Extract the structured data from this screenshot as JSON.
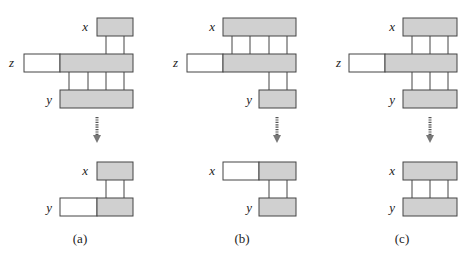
{
  "colors": {
    "filled": "#d0d0d0",
    "empty": "#ffffff",
    "stroke": "#444444"
  },
  "panels": [
    {
      "caption": "(a)",
      "labels": {
        "x_top": "x",
        "z": "z",
        "y_top": "y",
        "x_bottom": "x",
        "y_bottom": "y"
      }
    },
    {
      "caption": "(b)",
      "labels": {
        "x_top": "x",
        "z": "z",
        "y_top": "y",
        "x_bottom": "x",
        "y_bottom": "y"
      }
    },
    {
      "caption": "(c)",
      "labels": {
        "x_top": "x",
        "z": "z",
        "y_top": "y",
        "x_bottom": "x",
        "y_bottom": "y"
      }
    }
  ],
  "arrow_icon": "dotted-down-arrow-icon"
}
